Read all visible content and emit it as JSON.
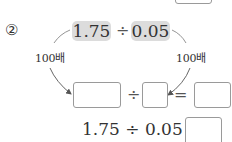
{
  "problem": {
    "number_label": "②",
    "dividend": "1.75",
    "divisor": "0.05",
    "div_symbol": "÷",
    "eq_symbol": "=",
    "left_multiplier_label": "100배",
    "right_multiplier_label": "100배",
    "answer_row": {
      "box1_value": "",
      "box2_value": "",
      "box3_value": ""
    },
    "final_equation": "1.75 ÷ 0.05 =",
    "final_answer_value": ""
  },
  "colors": {
    "highlight": "#dcdcdc",
    "box_border": "#9a9a9a",
    "arrow": "#666666",
    "text": "#333333"
  }
}
